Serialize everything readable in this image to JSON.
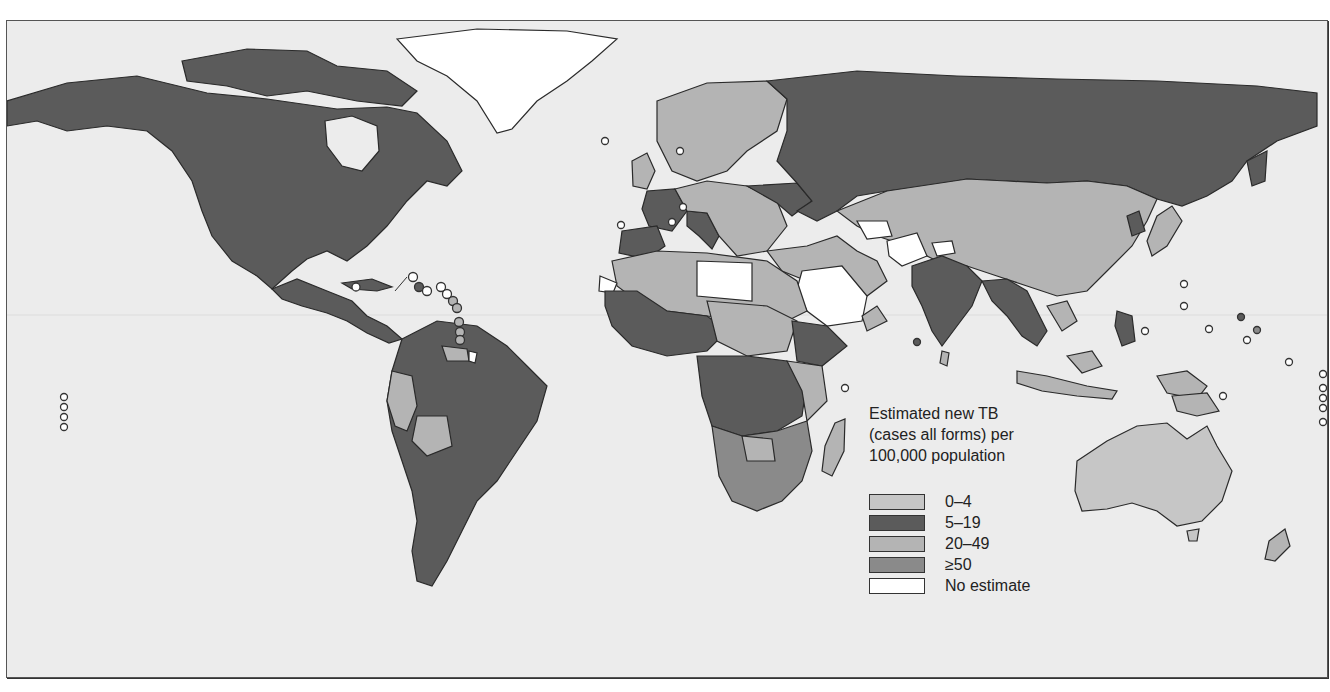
{
  "map": {
    "title": "Estimated new TB (cases all forms) per 100,000 population",
    "background_color": "#ececec",
    "legend": {
      "title_lines": [
        "Estimated new TB",
        "(cases all forms) per",
        "100,000 population"
      ],
      "items": [
        {
          "label": "0–4",
          "color": "#c6c6c6"
        },
        {
          "label": "5–19",
          "color": "#5b5b5b"
        },
        {
          "label": "20–49",
          "color": "#b4b4b4"
        },
        {
          "label": "≥50",
          "color": "#8a8a8a"
        },
        {
          "label": "No estimate",
          "color": "#ffffff"
        }
      ]
    },
    "regions": [
      {
        "name": "North America (USA/Canada)",
        "category": "5–19"
      },
      {
        "name": "Greenland",
        "category": "No estimate"
      },
      {
        "name": "Mexico & Central America",
        "category": "5–19"
      },
      {
        "name": "South America (most)",
        "category": "5–19"
      },
      {
        "name": "Peru / Bolivia",
        "category": "20–49"
      },
      {
        "name": "Western Europe (France, Spain, Italy)",
        "category": "5–19"
      },
      {
        "name": "Northern/Central Europe",
        "category": "20–49"
      },
      {
        "name": "Russia",
        "category": "5–19"
      },
      {
        "name": "China / Central Asia",
        "category": "20–49"
      },
      {
        "name": "Saudi Arabia / Libya / Afghanistan",
        "category": "No estimate"
      },
      {
        "name": "India / SE Asia",
        "category": "5–19"
      },
      {
        "name": "Sub-Saharan Africa (central)",
        "category": "5–19"
      },
      {
        "name": "Southern Africa",
        "category": "≥50"
      },
      {
        "name": "North Africa / Sahel",
        "category": "20–49"
      },
      {
        "name": "Australia",
        "category": "0–4"
      },
      {
        "name": "New Zealand",
        "category": "20–49"
      },
      {
        "name": "Madagascar",
        "category": "20–49"
      }
    ]
  }
}
